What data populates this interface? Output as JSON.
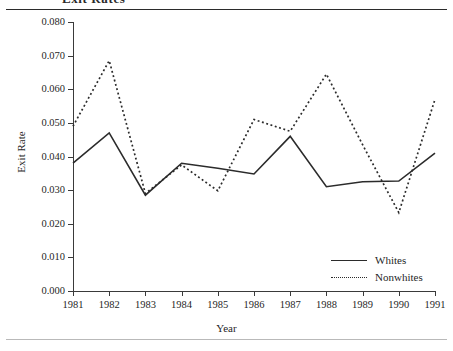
{
  "figure": {
    "header_text": "Exit Rates",
    "axis_title_x": "Year",
    "axis_title_y": "Exit Rate"
  },
  "chart_data": {
    "type": "line",
    "title": "",
    "xlabel": "Year",
    "ylabel": "Exit Rate",
    "x": [
      1981,
      1982,
      1983,
      1984,
      1985,
      1986,
      1987,
      1988,
      1989,
      1990,
      1991
    ],
    "xtick_labels": [
      "1981",
      "1982",
      "1983",
      "1984",
      "1985",
      "1986",
      "1987",
      "1988",
      "1989",
      "1990",
      "1991"
    ],
    "ytick_labels": [
      "0.000",
      "0.010",
      "0.020",
      "0.030",
      "0.040",
      "0.050",
      "0.060",
      "0.070",
      "0.080"
    ],
    "ytick_values": [
      0.0,
      0.01,
      0.02,
      0.03,
      0.04,
      0.05,
      0.06,
      0.07,
      0.08
    ],
    "ylim": [
      0.0,
      0.08
    ],
    "xlim": [
      1981,
      1991
    ],
    "grid": false,
    "legend_position": "lower-right-inside",
    "series": [
      {
        "name": "Whites",
        "style": "solid",
        "color": "#2b2b2b",
        "values": [
          0.038,
          0.047,
          0.0285,
          0.038,
          0.0365,
          0.0348,
          0.046,
          0.031,
          0.0325,
          0.0327,
          0.041
        ]
      },
      {
        "name": "Nonwhites",
        "style": "dotted",
        "color": "#2b2b2b",
        "values": [
          0.049,
          0.0685,
          0.029,
          0.0375,
          0.0298,
          0.051,
          0.0475,
          0.0645,
          0.0435,
          0.0233,
          0.057
        ]
      }
    ]
  }
}
